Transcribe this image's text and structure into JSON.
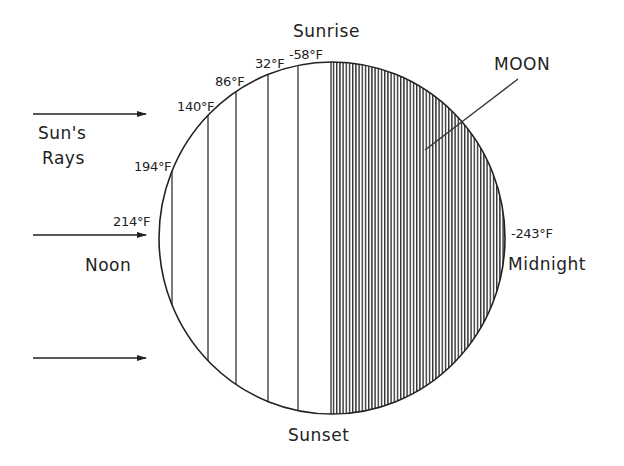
{
  "diagram": {
    "title_label": "MOON",
    "rays_label_line1": "Sun's",
    "rays_label_line2": "Rays",
    "positions": {
      "top": "Sunrise",
      "bottom": "Sunset",
      "left": "Noon",
      "right": "Midnight"
    },
    "temperatures": [
      {
        "label": "214°F",
        "id": "noon"
      },
      {
        "label": "194°F",
        "id": "t194"
      },
      {
        "label": "140°F",
        "id": "t140"
      },
      {
        "label": "86°F",
        "id": "t86"
      },
      {
        "label": "32°F",
        "id": "t32"
      },
      {
        "label": "-58°F",
        "id": "t-58"
      },
      {
        "label": "-243°F",
        "id": "midnight"
      }
    ],
    "arrow_count": 3,
    "colors": {
      "ink": "#222222",
      "background": "#ffffff"
    }
  }
}
